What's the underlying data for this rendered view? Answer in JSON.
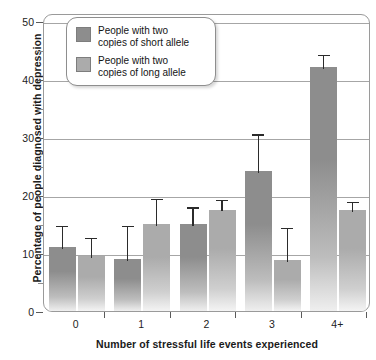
{
  "chart_data": {
    "type": "bar",
    "title": "",
    "xlabel": "Number of stressful life events experienced",
    "ylabel": "Percentage of people diagnosed with depression",
    "categories": [
      "0",
      "1",
      "2",
      "3",
      "4+"
    ],
    "ylim": [
      0,
      50
    ],
    "yticks": [
      0,
      10,
      20,
      30,
      40,
      50
    ],
    "yminorticks": [
      5,
      15,
      25,
      35,
      45
    ],
    "grid": "horizontal",
    "legend_position": "top-left",
    "series": [
      {
        "name": "People with two copies of short allele",
        "color": "#8d8d8d",
        "values": [
          11.0,
          9.0,
          15.0,
          24.2,
          42.0
        ],
        "error_high": [
          15.0,
          15.0,
          18.2,
          30.8,
          44.5
        ],
        "error_low": [
          11.0,
          9.0,
          15.0,
          24.2,
          42.0
        ]
      },
      {
        "name": "People with two copies of long allele",
        "color": "#ababab",
        "values": [
          9.4,
          15.0,
          17.5,
          8.8,
          17.4
        ],
        "error_high": [
          13.0,
          19.7,
          19.5,
          14.7,
          19.2
        ],
        "error_low": [
          9.4,
          15.0,
          17.5,
          8.8,
          17.4
        ]
      }
    ]
  },
  "legend": {
    "items": [
      {
        "label_line1": "People with two",
        "label_line2": "copies of short allele",
        "color": "#8d8d8d"
      },
      {
        "label_line1": "People with two",
        "label_line2": "copies of long allele",
        "color": "#ababab"
      }
    ]
  },
  "axes": {
    "y_title": "Percentage of people diagnosed with depression",
    "x_title": "Number of stressful life events experienced",
    "y_tick_labels": [
      "0",
      "10",
      "20",
      "30",
      "40",
      "50"
    ],
    "x_tick_labels": [
      "0",
      "1",
      "2",
      "3",
      "4+"
    ]
  }
}
